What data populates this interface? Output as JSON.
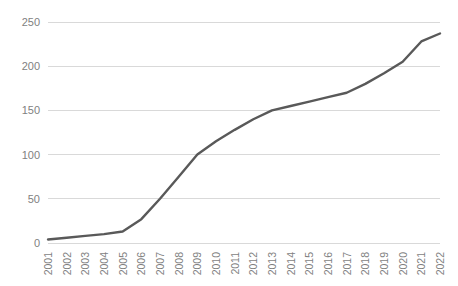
{
  "chart_data": {
    "type": "line",
    "title": "",
    "subtitle": "",
    "xlabel": "",
    "ylabel": "",
    "categories": [
      "2001",
      "2002",
      "2003",
      "2004",
      "2005",
      "2006",
      "2007",
      "2008",
      "2009",
      "2010",
      "2011",
      "2012",
      "2013",
      "2014",
      "2015",
      "2016",
      "2017",
      "2018",
      "2019",
      "2020",
      "2021",
      "2022"
    ],
    "series": [
      {
        "name": "",
        "color": "#595959",
        "values": [
          4,
          6,
          8,
          10,
          13,
          27,
          50,
          75,
          100,
          115,
          128,
          140,
          150,
          155,
          160,
          165,
          170,
          180,
          192,
          205,
          228,
          237
        ]
      }
    ],
    "ylim": [
      0,
      250
    ],
    "yticks": [
      0,
      50,
      100,
      150,
      200,
      250
    ],
    "ytick_labels": [
      "0",
      "50",
      "100",
      "150",
      "200",
      "250"
    ],
    "grid": true,
    "grid_axis": "y",
    "legend": false,
    "legend_position": "none",
    "markers": false,
    "xtick_rotation": 90,
    "colors": {
      "line": "#595959",
      "grid": "#d9d9d9",
      "tick_label": "#7f7f7f",
      "background": "#ffffff"
    }
  },
  "layout": {
    "width": 458,
    "height": 286,
    "plot_left": 48,
    "plot_right": 440,
    "plot_top": 22,
    "plot_bottom": 243
  }
}
